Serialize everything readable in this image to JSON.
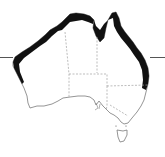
{
  "map": {
    "subject": "Australia distribution map",
    "colors": {
      "background": "#ffffff",
      "land": "#ffffff",
      "outline": "#7a7a7a",
      "range": "#111111",
      "borders": "#a0a0a0",
      "tropic_line": "#555555"
    },
    "features": {
      "range_band": "coastal distribution band along north-west, north and east coasts",
      "state_borders": "dashed",
      "tropic_marker": "horizontal ticks on left and right edges",
      "tasmania": "island shown south-east"
    }
  }
}
